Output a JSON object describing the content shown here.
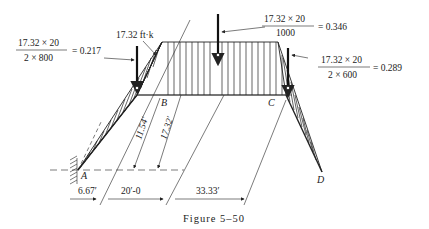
{
  "figure": {
    "caption": "Figure 5–50",
    "points": {
      "A": "A",
      "B": "B",
      "C": "C",
      "D": "D"
    },
    "moment_label": "17.32 ft·k",
    "annotations": {
      "left": {
        "numerator": "17.32 × 20",
        "denominator": "2 × 800",
        "result": "= 0.217"
      },
      "top": {
        "numerator": "17.32 × 20",
        "denominator": "1000",
        "result": "= 0.346"
      },
      "right": {
        "numerator": "17.32 × 20",
        "denominator": "2 × 600",
        "result": "= 0.289"
      }
    },
    "dimensions": {
      "d1": "11.54′",
      "d2": "17.32′",
      "span_a": "6.67′",
      "span_b": "20′-0",
      "span_c": "33.33′"
    }
  }
}
